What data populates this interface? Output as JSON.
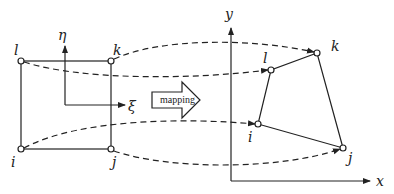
{
  "diagram": {
    "left_element": {
      "nodes": [
        {
          "id": "l",
          "label": "l",
          "x": 21,
          "y": 61,
          "lx": 14,
          "ly": 54
        },
        {
          "id": "k",
          "label": "k",
          "x": 111,
          "y": 61,
          "lx": 113,
          "ly": 54
        },
        {
          "id": "i",
          "label": "i",
          "x": 21,
          "y": 149,
          "lx": 11,
          "ly": 167
        },
        {
          "id": "j",
          "label": "j",
          "x": 111,
          "y": 149,
          "lx": 112,
          "ly": 167
        }
      ],
      "axes": {
        "eta_label": "η",
        "xi_label": "ξ"
      }
    },
    "mapping_arrow": {
      "label": "mapping"
    },
    "right_element": {
      "nodes": [
        {
          "id": "l",
          "label": "l",
          "x": 271,
          "y": 70,
          "lx": 263,
          "ly": 63
        },
        {
          "id": "k",
          "label": "k",
          "x": 317,
          "y": 53,
          "lx": 331,
          "ly": 51
        },
        {
          "id": "i",
          "label": "i",
          "x": 258,
          "y": 124,
          "lx": 248,
          "ly": 142
        },
        {
          "id": "j",
          "label": "j",
          "x": 343,
          "y": 148,
          "lx": 348,
          "ly": 163
        }
      ],
      "axes": {
        "x_label": "x",
        "y_label": "y"
      }
    },
    "colors": {
      "line": "#222222",
      "background": "#ffffff"
    }
  }
}
